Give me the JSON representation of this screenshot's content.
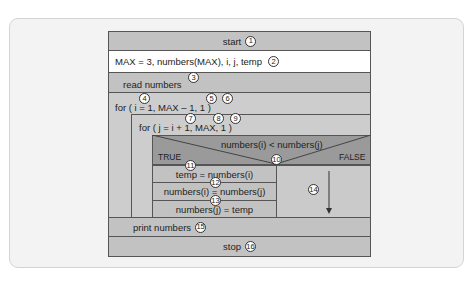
{
  "diagram": {
    "type": "Nassi-Shneiderman structured flowchart",
    "colors": {
      "block_gray": "#c2c2c2",
      "decision_gray": "#9a9a9a",
      "white_row": "#ffffff",
      "border": "#555555",
      "card_bg": "#f3f3f3"
    },
    "start": {
      "label": "start",
      "num": "1"
    },
    "declare": {
      "label": "MAX = 3, numbers(MAX), i, j, temp",
      "num": "2"
    },
    "read": {
      "label": "read numbers",
      "num": "3"
    },
    "outer_loop": {
      "label": "for ( i = 1, MAX – 1, 1 )",
      "nums": [
        "4",
        "5",
        "6"
      ]
    },
    "inner_loop": {
      "label": "for ( j = i + 1, MAX, 1 )",
      "nums": [
        "7",
        "8",
        "9"
      ]
    },
    "decision": {
      "condition": "numbers(i) < numbers(j)",
      "num": "10",
      "true_label": "TRUE",
      "false_label": "FALSE"
    },
    "true_branch": [
      {
        "label": "temp = numbers(i)",
        "num": "11"
      },
      {
        "label": "numbers(i) = numbers(j)",
        "num": "12"
      },
      {
        "label": "numbers(j) = temp",
        "num": "13"
      }
    ],
    "false_branch": {
      "num": "14",
      "icon": "down-arrow-icon"
    },
    "print": {
      "label": "print numbers",
      "num": "15"
    },
    "stop": {
      "label": "stop",
      "num": "16"
    }
  }
}
